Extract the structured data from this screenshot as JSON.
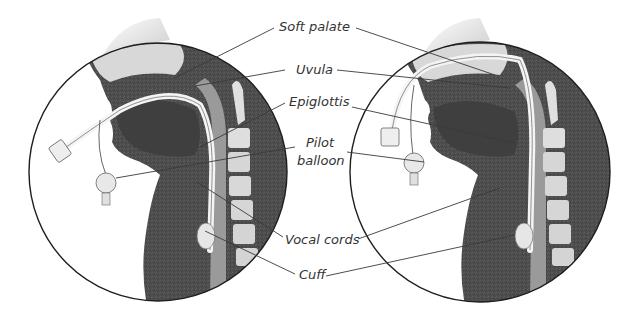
{
  "figure": {
    "background": "#ffffff",
    "tissue_color": "#4a4a4a",
    "line_color": "#333333"
  },
  "panels": [
    {
      "name": "oral-intubation",
      "cx": 158,
      "cy": 172,
      "r": 129
    },
    {
      "name": "nasal-intubation",
      "cx": 480,
      "cy": 172,
      "r": 130
    }
  ],
  "labels": {
    "soft_palate": "Soft palate",
    "uvula": "Uvula",
    "epiglottis": "Epiglottis",
    "pilot": "Pilot",
    "balloon": "balloon",
    "vocal_cords": "Vocal cords",
    "cuff": "Cuff"
  }
}
